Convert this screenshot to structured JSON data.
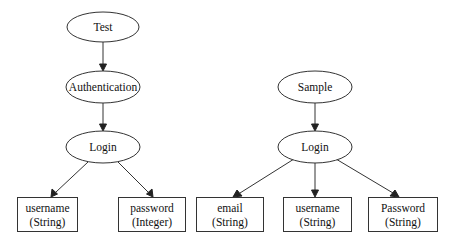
{
  "diagram": {
    "type": "tree",
    "trees": [
      {
        "root": "Test",
        "nodes": [
          {
            "id": "test",
            "label": "Test",
            "shape": "ellipse"
          },
          {
            "id": "auth",
            "label": "Authentication",
            "shape": "ellipse"
          },
          {
            "id": "login1",
            "label": "Login",
            "shape": "ellipse"
          },
          {
            "id": "username1",
            "label": "username",
            "type_label": "(String)",
            "shape": "box"
          },
          {
            "id": "password1",
            "label": "password",
            "type_label": "(Integer)",
            "shape": "box"
          }
        ],
        "edges": [
          {
            "from": "Test",
            "to": "Authentication"
          },
          {
            "from": "Authentication",
            "to": "Login"
          },
          {
            "from": "Login",
            "to": "username (String)"
          },
          {
            "from": "Login",
            "to": "password (Integer)"
          }
        ]
      },
      {
        "root": "Sample",
        "nodes": [
          {
            "id": "sample",
            "label": "Sample",
            "shape": "ellipse"
          },
          {
            "id": "login2",
            "label": "Login",
            "shape": "ellipse"
          },
          {
            "id": "email2",
            "label": "email",
            "type_label": "(String)",
            "shape": "box"
          },
          {
            "id": "username2",
            "label": "username",
            "type_label": "(String)",
            "shape": "box"
          },
          {
            "id": "password2",
            "label": "Password",
            "type_label": "(String)",
            "shape": "box"
          }
        ],
        "edges": [
          {
            "from": "Sample",
            "to": "Login"
          },
          {
            "from": "Login",
            "to": "email (String)"
          },
          {
            "from": "Login",
            "to": "username (String)"
          },
          {
            "from": "Login",
            "to": "Password (String)"
          }
        ]
      }
    ]
  },
  "labels": {
    "test": "Test",
    "auth": "Authentication",
    "login1": "Login",
    "username1": "username",
    "username1_type": "(String)",
    "password1": "password",
    "password1_type": "(Integer)",
    "sample": "Sample",
    "login2": "Login",
    "email2": "email",
    "email2_type": "(String)",
    "username2": "username",
    "username2_type": "(String)",
    "password2": "Password",
    "password2_type": "(String)"
  },
  "colors": {
    "background": "#ffffff",
    "stroke": "#333333",
    "text": "#111111"
  }
}
